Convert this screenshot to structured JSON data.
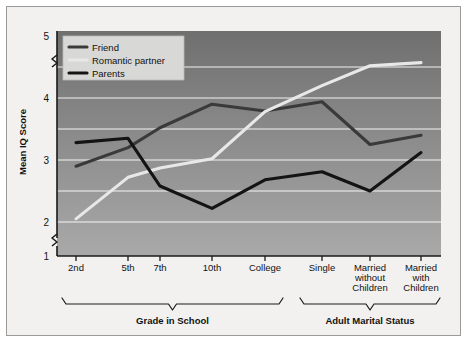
{
  "chart_data": {
    "type": "line",
    "title": "",
    "subtitle": "",
    "xlabel": "",
    "ylabel": "Mean IQ Score",
    "ylim": [
      1,
      5
    ],
    "yticks": [
      1,
      2,
      3,
      4,
      5
    ],
    "ytick_labels": [
      "1",
      "2",
      "3",
      "4",
      "5"
    ],
    "y_axis_break": true,
    "y_axis_break_between": [
      1,
      2
    ],
    "grid": true,
    "gridlines_y": [
      2.0,
      2.5,
      3.0,
      3.5,
      4.0,
      4.5
    ],
    "legend_position": "top-left",
    "categories": [
      "2nd",
      "5th",
      "7th",
      "10th",
      "College",
      "Single",
      "Married without Children",
      "Married with Children"
    ],
    "group_brackets": [
      {
        "label": "Grade in School",
        "categories": [
          "2nd",
          "5th",
          "7th",
          "10th",
          "College"
        ]
      },
      {
        "label": "Adult Marital Status",
        "categories": [
          "Single",
          "Married without Children",
          "Married with Children"
        ]
      }
    ],
    "series": [
      {
        "name": "Friend",
        "color": "#3a3a3a",
        "values": [
          2.9,
          3.2,
          3.52,
          3.9,
          3.79,
          3.94,
          3.25,
          3.4
        ]
      },
      {
        "name": "Romantic partner",
        "color": "#e8e8e8",
        "values": [
          2.05,
          2.72,
          2.87,
          3.02,
          3.78,
          4.2,
          4.52,
          4.57
        ]
      },
      {
        "name": "Parents",
        "color": "#141414",
        "values": [
          3.28,
          3.35,
          2.58,
          2.22,
          2.68,
          2.81,
          2.5,
          3.12
        ]
      }
    ]
  },
  "axes": {
    "ylabel": "Mean IQ Score"
  },
  "legend": {
    "items": [
      {
        "label": "Friend",
        "color": "#3a3a3a"
      },
      {
        "label": "Romantic partner",
        "color": "#e8e8e8"
      },
      {
        "label": "Parents",
        "color": "#141414"
      }
    ]
  },
  "xaxis": {
    "tick_labels": [
      {
        "lines": [
          "2nd"
        ]
      },
      {
        "lines": [
          "5th"
        ]
      },
      {
        "lines": [
          "7th"
        ]
      },
      {
        "lines": [
          "10th"
        ]
      },
      {
        "lines": [
          "College"
        ]
      },
      {
        "lines": [
          "Single"
        ]
      },
      {
        "lines": [
          "Married",
          "without",
          "Children"
        ]
      },
      {
        "lines": [
          "Married",
          "with",
          "Children"
        ]
      }
    ]
  },
  "brackets": [
    {
      "label": "Grade in School"
    },
    {
      "label": "Adult Marital Status"
    }
  ],
  "colors": {
    "card_bg": "#f2f1ef",
    "card_border": "#9a9a9a",
    "plot_dark": "#6f6f6f",
    "plot_light": "#a9a9a9",
    "gridline": "#ffffff",
    "axis": "#1a1a1a",
    "legend_bg": "#d8d8d6",
    "text": "#111111"
  }
}
